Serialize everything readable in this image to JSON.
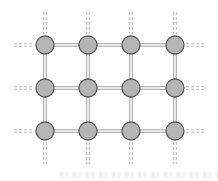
{
  "diagram": {
    "type": "lattice-grid",
    "columns_x": [
      45,
      88,
      131,
      175
    ],
    "rows_y": [
      45,
      88,
      131
    ],
    "node_radius": 9,
    "stub_length": 28,
    "colors": {
      "node_fill": "#b5b5b5",
      "node_stroke": "#5a5a5a",
      "edge": "#a8a8a8",
      "stub": "#b8b8b8",
      "background": "#ffffff"
    },
    "nodes": [
      {
        "row": 0,
        "col": 0
      },
      {
        "row": 0,
        "col": 1
      },
      {
        "row": 0,
        "col": 2
      },
      {
        "row": 0,
        "col": 3
      },
      {
        "row": 1,
        "col": 0
      },
      {
        "row": 1,
        "col": 1
      },
      {
        "row": 1,
        "col": 2
      },
      {
        "row": 1,
        "col": 3
      },
      {
        "row": 2,
        "col": 0
      },
      {
        "row": 2,
        "col": 1
      },
      {
        "row": 2,
        "col": 2
      },
      {
        "row": 2,
        "col": 3
      }
    ],
    "edge_style": "solid double line",
    "boundary_stub_style": "dashed double line"
  },
  "footer": {
    "note": "faint illegible bleed-through text"
  }
}
